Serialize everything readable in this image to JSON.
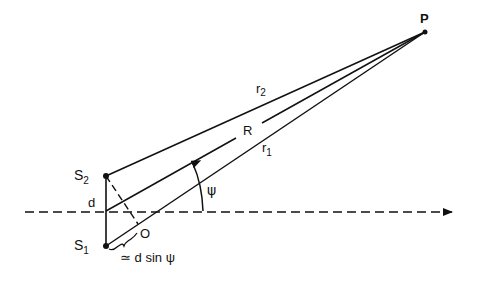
{
  "diagram": {
    "type": "two-source interference geometry",
    "points": {
      "P": {
        "label": "P",
        "x": 425,
        "y": 32
      },
      "S2": {
        "label": "S",
        "sub": "2",
        "x": 106,
        "y": 176
      },
      "S1": {
        "label": "S",
        "sub": "1",
        "x": 106,
        "y": 246
      },
      "mid": {
        "label": "d",
        "x": 106,
        "y": 211
      },
      "O": {
        "label": "O",
        "x": 138,
        "y": 224
      }
    },
    "lines": {
      "r2": {
        "label": "r",
        "sub": "2",
        "from": "S2",
        "to": "P"
      },
      "R": {
        "label": "R",
        "from": "mid",
        "to": "P"
      },
      "r1": {
        "label": "r",
        "sub": "1",
        "from": "S1",
        "to": "P"
      },
      "baseline": {
        "style": "dashed",
        "arrow": true
      },
      "perpendicular": {
        "style": "dashed",
        "from": "S2",
        "to": "O"
      }
    },
    "angle": {
      "label": "ψ"
    },
    "path_difference": {
      "label": "≃ d sin ψ"
    },
    "colors": {
      "stroke": "#111111",
      "background": "#ffffff"
    }
  }
}
